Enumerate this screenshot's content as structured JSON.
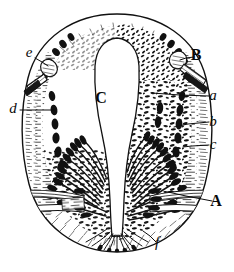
{
  "figure": {
    "kind": "anatomical-cross-section",
    "style": "black-and-white line engraving",
    "width": 234,
    "height": 272,
    "background_color": "#ffffff",
    "ink_color": "#111111",
    "orientation": "vertical oval, bilaterally symmetric about vertical axis"
  },
  "labels": [
    {
      "id": "label-A",
      "text": "A",
      "style": "capital",
      "text_x": 216,
      "text_y": 206,
      "leader": [
        [
          212,
          201
        ],
        [
          186,
          196
        ],
        [
          168,
          192
        ]
      ],
      "refers_to": "nerve bundle emerging at lower right"
    },
    {
      "id": "label-B",
      "text": "B",
      "style": "capital",
      "text_x": 196,
      "text_y": 60,
      "leader": [
        [
          194,
          57
        ],
        [
          186,
          58
        ],
        [
          180,
          60
        ]
      ],
      "refers_to": "rounded accessory body with striated stalk at upper right"
    },
    {
      "id": "label-C",
      "text": "C",
      "style": "capital",
      "text_x": 101,
      "text_y": 103,
      "leader": [],
      "refers_to": "central lumen / cavity"
    },
    {
      "id": "label-a",
      "text": "a",
      "style": "italic",
      "text_x": 213,
      "text_y": 100,
      "leader": [
        [
          209,
          96
        ],
        [
          180,
          95
        ],
        [
          152,
          93
        ]
      ],
      "refers_to": "inner dense cellular layer"
    },
    {
      "id": "label-b",
      "text": "b",
      "style": "italic",
      "text_x": 213,
      "text_y": 126,
      "leader": [
        [
          209,
          122
        ],
        [
          188,
          124
        ],
        [
          174,
          127
        ]
      ],
      "refers_to": "pigment cell layer"
    },
    {
      "id": "label-c",
      "text": "c",
      "style": "italic",
      "text_x": 213,
      "text_y": 149,
      "leader": [
        [
          209,
          145
        ],
        [
          192,
          146
        ],
        [
          183,
          147
        ]
      ],
      "refers_to": "striated outer capsule"
    },
    {
      "id": "label-d",
      "text": "d",
      "style": "italic",
      "text_x": 13,
      "text_y": 113,
      "leader": [
        [
          20,
          110
        ],
        [
          40,
          110
        ],
        [
          54,
          110
        ]
      ],
      "refers_to": "outer capsule on left side"
    },
    {
      "id": "label-e",
      "text": "e",
      "style": "italic",
      "text_x": 29,
      "text_y": 57,
      "leader": [
        [
          35,
          58
        ],
        [
          42,
          62
        ],
        [
          48,
          66
        ]
      ],
      "refers_to": "rounded accessory body at upper left"
    },
    {
      "id": "label-f",
      "text": "f",
      "style": "italic",
      "text_x": 157,
      "text_y": 247,
      "leader": [
        [
          156,
          242
        ],
        [
          150,
          236
        ],
        [
          143,
          231
        ]
      ],
      "refers_to": "basal region at bottom of section"
    }
  ]
}
